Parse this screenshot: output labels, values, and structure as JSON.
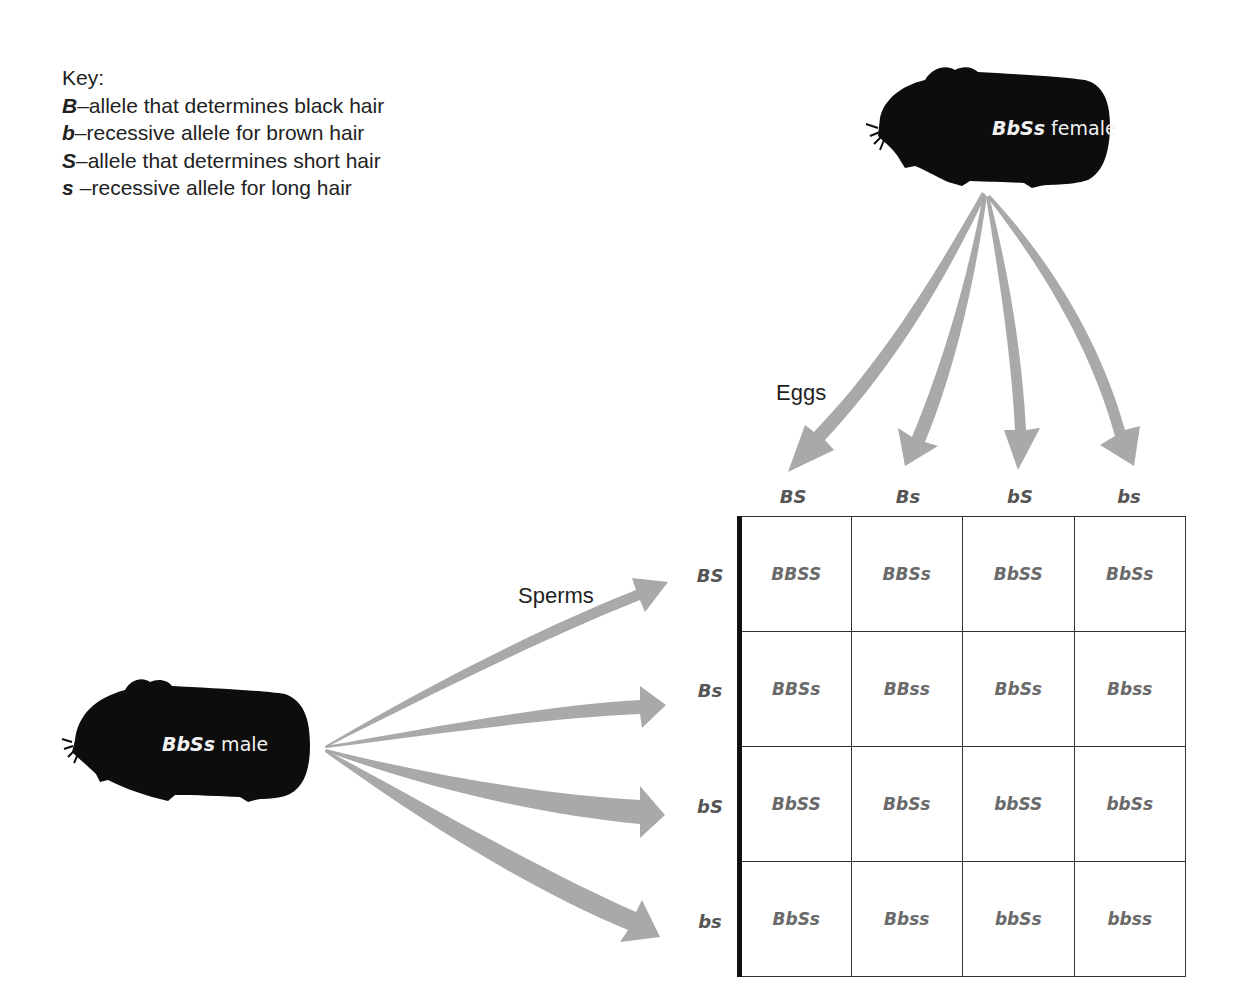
{
  "key": {
    "title": "Key:",
    "entries": [
      {
        "allele": "B",
        "text": "–allele that determines black hair"
      },
      {
        "allele": "b",
        "text": "–recessive allele for brown hair"
      },
      {
        "allele": "S",
        "text": "–allele that determines short hair"
      },
      {
        "allele": "s",
        "text": " –recessive allele for long hair"
      }
    ]
  },
  "female": {
    "genotype": "BbSs",
    "sex": " female"
  },
  "male": {
    "genotype": "BbSs",
    "sex": " male"
  },
  "labels": {
    "eggs": "Eggs",
    "sperms": "Sperms"
  },
  "eggs": [
    "BS",
    "Bs",
    "bS",
    "bs"
  ],
  "sperms": [
    "BS",
    "Bs",
    "bS",
    "bs"
  ],
  "punnett": [
    [
      "BBSS",
      "BBSs",
      "BbSS",
      "BbSs"
    ],
    [
      "BBSs",
      "BBss",
      "BbSs",
      "Bbss"
    ],
    [
      "BbSS",
      "BbSs",
      "bbSS",
      "bbSs"
    ],
    [
      "BbSs",
      "Bbss",
      "bbSs",
      "bbss"
    ]
  ],
  "colors": {
    "arrow": "#a9a9a9",
    "silhouette": "#0d0d0d",
    "cell_text": "#6a6a6a"
  }
}
